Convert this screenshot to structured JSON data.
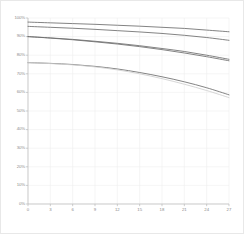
{
  "chart_data": {
    "type": "line",
    "title": "",
    "subtitle": "",
    "xlabel": "",
    "ylabel": "",
    "xlim": [
      0,
      27
    ],
    "ylim": [
      0,
      1.0
    ],
    "grid": true,
    "legend": "none",
    "x_ticks": [
      0,
      3,
      6,
      9,
      12,
      15,
      18,
      21,
      24,
      27
    ],
    "x_tick_labels": [
      "0",
      "3",
      "6",
      "9",
      "12",
      "15",
      "18",
      "21",
      "24",
      "27"
    ],
    "y_ticks": [
      0,
      0.1,
      0.2,
      0.3,
      0.4,
      0.5,
      0.6,
      0.7,
      0.8,
      0.9,
      1.0
    ],
    "y_tick_labels": [
      "0%",
      "10%",
      "20%",
      "30%",
      "40%",
      "50%",
      "60%",
      "70%",
      "80%",
      "90%",
      "100%"
    ],
    "x": [
      0,
      3,
      6,
      9,
      12,
      15,
      18,
      21,
      24,
      27
    ],
    "series": [
      {
        "name": "series-1",
        "color": "#6d6d6d",
        "style": "solid",
        "values": [
          0.978,
          0.974,
          0.97,
          0.966,
          0.961,
          0.956,
          0.95,
          0.944,
          0.935,
          0.926
        ]
      },
      {
        "name": "series-2",
        "color": "#6d6d6d",
        "style": "solid",
        "values": [
          0.955,
          0.95,
          0.945,
          0.939,
          0.932,
          0.925,
          0.917,
          0.907,
          0.895,
          0.88
        ]
      },
      {
        "name": "series-3",
        "color": "#6d6d6d",
        "style": "solid",
        "values": [
          0.9,
          0.893,
          0.885,
          0.875,
          0.864,
          0.851,
          0.836,
          0.82,
          0.8,
          0.778
        ]
      },
      {
        "name": "series-4",
        "color": "#6d6d6d",
        "style": "solid",
        "values": [
          0.9,
          0.892,
          0.883,
          0.872,
          0.86,
          0.846,
          0.83,
          0.812,
          0.792,
          0.77
        ]
      },
      {
        "name": "series-5",
        "color": "#6d6d6d",
        "style": "solid",
        "values": [
          0.76,
          0.756,
          0.75,
          0.74,
          0.726,
          0.707,
          0.684,
          0.657,
          0.625,
          0.587
        ]
      },
      {
        "name": "series-6",
        "color": "#cfcfcf",
        "style": "solid",
        "values": [
          0.76,
          0.755,
          0.748,
          0.737,
          0.721,
          0.7,
          0.674,
          0.644,
          0.61,
          0.572
        ]
      }
    ]
  }
}
